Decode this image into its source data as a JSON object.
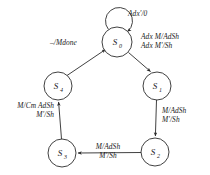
{
  "diagram": {
    "type": "finite-state-machine",
    "title": "",
    "background_color": "#ffffff",
    "stroke_color": "#2b2b2b",
    "text_color": "#1a1a1a",
    "states": [
      {
        "id": "S0",
        "label": "S",
        "subscript": "0",
        "cx": 117,
        "cy": 42,
        "r": 15
      },
      {
        "id": "S1",
        "label": "S",
        "subscript": "1",
        "cx": 157,
        "cy": 86,
        "r": 14
      },
      {
        "id": "S2",
        "label": "S",
        "subscript": "2",
        "cx": 155,
        "cy": 152,
        "r": 14
      },
      {
        "id": "S3",
        "label": "S",
        "subscript": "3",
        "cx": 62,
        "cy": 153,
        "r": 14
      },
      {
        "id": "S4",
        "label": "S",
        "subscript": "4",
        "cx": 58,
        "cy": 86,
        "r": 14
      }
    ],
    "transitions": [
      {
        "id": "t-self-s0",
        "from": "S0",
        "to": "S0",
        "kind": "self-loop",
        "lines": [
          "Adx'/0"
        ],
        "label_x": 128,
        "label_y": 9,
        "align": "left"
      },
      {
        "id": "t-s0-s1",
        "from": "S0",
        "to": "S1",
        "kind": "line",
        "lines": [
          "Adx M/AdSh",
          "Adx M'/Sh"
        ],
        "label_x": 141,
        "label_y": 32,
        "align": "left"
      },
      {
        "id": "t-s1-s2",
        "from": "S1",
        "to": "S2",
        "kind": "line",
        "lines": [
          "M/AdSh",
          "M'/Sh"
        ],
        "label_x": 162,
        "label_y": 106,
        "align": "left"
      },
      {
        "id": "t-s2-s3",
        "from": "S2",
        "to": "S3",
        "kind": "line",
        "lines": [
          "M/AdSh",
          "M'/Sh"
        ],
        "label_x": 108,
        "label_y": 142,
        "align": "center"
      },
      {
        "id": "t-s3-s4",
        "from": "S3",
        "to": "S4",
        "kind": "line",
        "lines": [
          "M/Cm AdSh",
          "M'/Sh"
        ],
        "label_x": 54,
        "label_y": 101,
        "align": "right"
      },
      {
        "id": "t-s4-s0",
        "from": "S4",
        "to": "S0",
        "kind": "line",
        "lines": [
          "–/Mdone"
        ],
        "label_x": 77,
        "label_y": 38,
        "align": "right"
      }
    ]
  }
}
